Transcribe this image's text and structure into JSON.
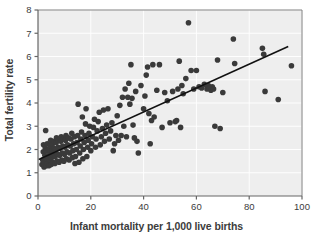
{
  "chart_data": {
    "type": "scatter",
    "title": "",
    "xlabel": "Infant mortality per 1,000 live births",
    "ylabel": "Total fertility rate",
    "xlim": [
      0,
      100
    ],
    "ylim": [
      0,
      8
    ],
    "xticks": [
      0,
      20,
      40,
      60,
      80,
      100
    ],
    "yticks": [
      0,
      1,
      2,
      3,
      4,
      5,
      6,
      7,
      8
    ],
    "grid": true,
    "legend": null,
    "plot_bg_color": "#eeeeee",
    "point_color": "#3a3a3a",
    "point_size_px": 5.6,
    "trendline": {
      "type": "line",
      "color": "#111111",
      "width_px": 1.6,
      "x_start": 0.5,
      "y_start": 1.58,
      "x_end": 94.5,
      "y_end": 6.42
    },
    "points": [
      [
        1.5,
        1.35
      ],
      [
        1.8,
        1.55
      ],
      [
        2.0,
        1.9
      ],
      [
        2.1,
        2.2
      ],
      [
        2.3,
        1.25
      ],
      [
        2.4,
        1.45
      ],
      [
        2.6,
        1.75
      ],
      [
        2.8,
        2.05
      ],
      [
        2.9,
        2.82
      ],
      [
        3.0,
        1.3
      ],
      [
        3.2,
        1.6
      ],
      [
        3.3,
        1.95
      ],
      [
        3.5,
        2.25
      ],
      [
        3.6,
        1.4
      ],
      [
        3.8,
        1.7
      ],
      [
        4.0,
        2.0
      ],
      [
        4.1,
        1.3
      ],
      [
        4.3,
        1.55
      ],
      [
        4.5,
        1.85
      ],
      [
        4.6,
        2.15
      ],
      [
        4.8,
        2.4
      ],
      [
        5.0,
        1.35
      ],
      [
        5.1,
        1.65
      ],
      [
        5.3,
        1.95
      ],
      [
        5.5,
        2.25
      ],
      [
        5.6,
        1.45
      ],
      [
        5.8,
        1.75
      ],
      [
        6.0,
        2.05
      ],
      [
        6.2,
        2.35
      ],
      [
        6.4,
        1.4
      ],
      [
        6.5,
        1.7
      ],
      [
        6.7,
        2.0
      ],
      [
        6.9,
        2.3
      ],
      [
        7.0,
        2.5
      ],
      [
        7.2,
        1.5
      ],
      [
        7.4,
        1.8
      ],
      [
        7.6,
        2.1
      ],
      [
        7.8,
        2.4
      ],
      [
        8.0,
        1.45
      ],
      [
        8.2,
        1.75
      ],
      [
        8.4,
        2.05
      ],
      [
        8.6,
        2.35
      ],
      [
        8.8,
        2.55
      ],
      [
        9.0,
        1.55
      ],
      [
        9.2,
        1.85
      ],
      [
        9.4,
        2.15
      ],
      [
        9.6,
        2.45
      ],
      [
        9.8,
        1.5
      ],
      [
        10.0,
        1.8
      ],
      [
        10.2,
        2.1
      ],
      [
        10.4,
        2.4
      ],
      [
        10.6,
        2.6
      ],
      [
        10.8,
        1.6
      ],
      [
        11.0,
        1.9
      ],
      [
        11.2,
        2.2
      ],
      [
        11.5,
        2.5
      ],
      [
        11.8,
        1.55
      ],
      [
        12.0,
        1.85
      ],
      [
        12.2,
        2.15
      ],
      [
        12.5,
        2.45
      ],
      [
        12.8,
        2.7
      ],
      [
        13.0,
        1.65
      ],
      [
        13.2,
        1.95
      ],
      [
        13.5,
        2.25
      ],
      [
        13.8,
        2.55
      ],
      [
        14.0,
        1.4
      ],
      [
        14.2,
        1.7
      ],
      [
        14.5,
        2.0
      ],
      [
        14.8,
        2.3
      ],
      [
        15.0,
        2.6
      ],
      [
        15.2,
        3.95
      ],
      [
        15.5,
        1.45
      ],
      [
        15.8,
        1.85
      ],
      [
        16.0,
        2.15
      ],
      [
        16.2,
        2.45
      ],
      [
        16.5,
        2.75
      ],
      [
        16.8,
        3.4
      ],
      [
        17.0,
        1.6
      ],
      [
        17.2,
        2.0
      ],
      [
        17.5,
        2.3
      ],
      [
        17.8,
        2.6
      ],
      [
        18.0,
        3.1
      ],
      [
        18.2,
        3.75
      ],
      [
        18.5,
        1.7
      ],
      [
        18.8,
        2.1
      ],
      [
        19.0,
        2.4
      ],
      [
        19.3,
        2.7
      ],
      [
        19.6,
        3.0
      ],
      [
        20.0,
        1.95
      ],
      [
        20.3,
        2.25
      ],
      [
        20.6,
        2.55
      ],
      [
        21.0,
        2.95
      ],
      [
        21.4,
        3.3
      ],
      [
        21.8,
        2.1
      ],
      [
        22.0,
        2.45
      ],
      [
        22.4,
        2.8
      ],
      [
        22.8,
        3.2
      ],
      [
        23.2,
        3.6
      ],
      [
        23.6,
        2.2
      ],
      [
        24.0,
        2.55
      ],
      [
        24.4,
        2.9
      ],
      [
        24.8,
        3.7
      ],
      [
        25.2,
        2.35
      ],
      [
        25.6,
        2.7
      ],
      [
        26.0,
        3.05
      ],
      [
        26.5,
        3.75
      ],
      [
        27.0,
        2.45
      ],
      [
        27.5,
        2.8
      ],
      [
        28.0,
        3.15
      ],
      [
        28.5,
        1.95
      ],
      [
        29.0,
        2.25
      ],
      [
        29.5,
        2.6
      ],
      [
        30.0,
        3.45
      ],
      [
        30.5,
        2.4
      ],
      [
        31.0,
        3.9
      ],
      [
        31.5,
        2.6
      ],
      [
        32.0,
        4.25
      ],
      [
        32.5,
        3.0
      ],
      [
        33.0,
        4.6
      ],
      [
        33.5,
        2.55
      ],
      [
        34.0,
        4.25
      ],
      [
        34.4,
        4.85
      ],
      [
        34.8,
        3.95
      ],
      [
        35.2,
        5.65
      ],
      [
        35.6,
        4.2
      ],
      [
        36.0,
        3.05
      ],
      [
        36.5,
        2.5
      ],
      [
        37.0,
        4.5
      ],
      [
        37.5,
        2.35
      ],
      [
        38.0,
        1.85
      ],
      [
        39.0,
        4.75
      ],
      [
        40.0,
        3.75
      ],
      [
        40.5,
        4.3
      ],
      [
        41.0,
        5.2
      ],
      [
        41.5,
        5.55
      ],
      [
        42.0,
        3.55
      ],
      [
        42.5,
        2.25
      ],
      [
        43.0,
        3.25
      ],
      [
        43.5,
        5.65
      ],
      [
        44.0,
        3.4
      ],
      [
        45.0,
        4.55
      ],
      [
        46.0,
        5.65
      ],
      [
        47.0,
        2.95
      ],
      [
        48.0,
        4.45
      ],
      [
        49.0,
        4.1
      ],
      [
        50.0,
        3.15
      ],
      [
        51.0,
        4.5
      ],
      [
        52.0,
        3.2
      ],
      [
        52.5,
        3.25
      ],
      [
        53.0,
        4.6
      ],
      [
        53.5,
        5.8
      ],
      [
        54.0,
        2.95
      ],
      [
        54.5,
        4.75
      ],
      [
        55.0,
        4.4
      ],
      [
        56.0,
        5.05
      ],
      [
        57.0,
        7.45
      ],
      [
        58.0,
        5.4
      ],
      [
        59.0,
        4.6
      ],
      [
        60.0,
        5.4
      ],
      [
        61.0,
        4.7
      ],
      [
        62.0,
        4.65
      ],
      [
        63.0,
        4.8
      ],
      [
        64.0,
        4.6
      ],
      [
        64.5,
        4.75
      ],
      [
        65.0,
        4.65
      ],
      [
        65.5,
        4.55
      ],
      [
        66.0,
        4.7
      ],
      [
        66.5,
        4.6
      ],
      [
        67.0,
        3.0
      ],
      [
        68.0,
        5.85
      ],
      [
        69.0,
        2.9
      ],
      [
        70.0,
        4.45
      ],
      [
        74.0,
        6.75
      ],
      [
        74.5,
        5.7
      ],
      [
        85.0,
        6.35
      ],
      [
        85.5,
        6.1
      ],
      [
        86.0,
        4.5
      ],
      [
        91.0,
        4.15
      ],
      [
        96.0,
        5.6
      ]
    ]
  }
}
